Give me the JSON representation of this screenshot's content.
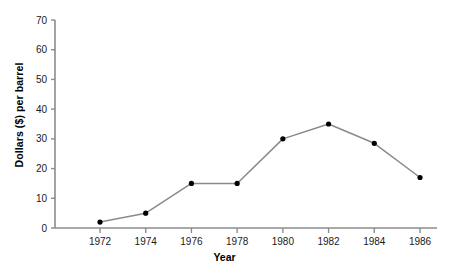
{
  "chart_data": {
    "type": "line",
    "title": "",
    "xlabel": "Year",
    "ylabel": "Dollars ($) per barrel",
    "x": [
      1972,
      1974,
      1976,
      1978,
      1980,
      1982,
      1984,
      1986
    ],
    "categories": [
      "1972",
      "1974",
      "1976",
      "1978",
      "1980",
      "1982",
      "1984",
      "1986"
    ],
    "values": [
      2,
      5,
      15,
      15,
      30,
      35,
      28.5,
      17
    ],
    "series": [
      {
        "name": "Price per barrel",
        "values": [
          2,
          5,
          15,
          15,
          30,
          35,
          28.5,
          17
        ]
      }
    ],
    "xlim": [
      1971,
      1987
    ],
    "ylim": [
      0,
      70
    ],
    "ytick_labels": [
      "0",
      "10",
      "20",
      "30",
      "40",
      "50",
      "60",
      "70"
    ],
    "ytick_values": [
      0,
      10,
      20,
      30,
      40,
      50,
      60,
      70
    ],
    "xtick_labels": [
      "1972",
      "1974",
      "1976",
      "1978",
      "1980",
      "1982",
      "1984",
      "1986"
    ],
    "grid": false,
    "legend": false,
    "legend_position": "none",
    "marker": "circle",
    "line_color": "#8a8a8a",
    "marker_color": "#000000",
    "axis_color": "#8c8c8c",
    "background_color": "#ffffff"
  },
  "axes": {
    "y_title": "Dollars ($) per barrel",
    "x_title": "Year"
  }
}
